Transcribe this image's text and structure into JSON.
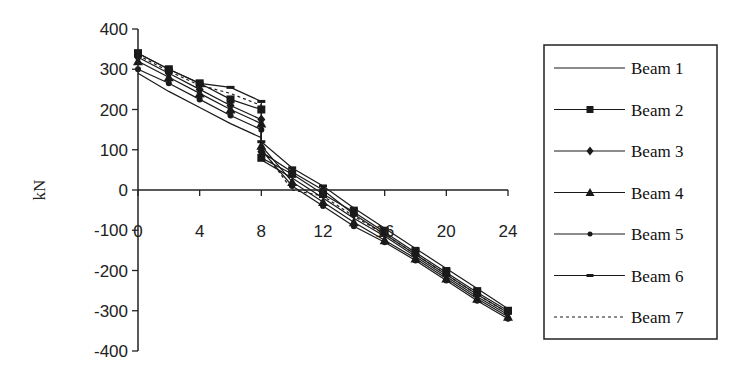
{
  "chart_data": {
    "type": "line",
    "title": "",
    "xlabel": "",
    "ylabel": "kN",
    "xlim": [
      0,
      24
    ],
    "ylim": [
      -400,
      400
    ],
    "x_ticks": [
      0,
      4,
      8,
      12,
      16,
      20,
      24
    ],
    "y_ticks": [
      400,
      300,
      200,
      100,
      0,
      -100,
      -200,
      -300,
      -400
    ],
    "grid": false,
    "legend_position": "right",
    "x": [
      0,
      2,
      4,
      6,
      8,
      8,
      10,
      12,
      14,
      16,
      18,
      20,
      22,
      24
    ],
    "series": [
      {
        "name": "Beam 1",
        "marker": "none",
        "dash": "solid",
        "values": [
          290,
          245,
          205,
          165,
          130,
          75,
          30,
          -20,
          -70,
          -115,
          -165,
          -215,
          -265,
          -310
        ]
      },
      {
        "name": "Beam 2",
        "marker": "square",
        "dash": "solid",
        "values": [
          340,
          300,
          265,
          225,
          200,
          80,
          40,
          -10,
          -55,
          -105,
          -155,
          -205,
          -255,
          -300
        ]
      },
      {
        "name": "Beam 3",
        "marker": "diamond",
        "dash": "solid",
        "values": [
          330,
          290,
          250,
          210,
          175,
          95,
          45,
          0,
          -60,
          -110,
          -160,
          -210,
          -260,
          -305
        ]
      },
      {
        "name": "Beam 4",
        "marker": "triangle",
        "dash": "solid",
        "values": [
          320,
          280,
          240,
          200,
          165,
          110,
          20,
          -30,
          -80,
          -125,
          -170,
          -220,
          -270,
          -315
        ]
      },
      {
        "name": "Beam 5",
        "marker": "circle",
        "dash": "solid",
        "values": [
          300,
          265,
          225,
          185,
          150,
          100,
          10,
          -40,
          -90,
          -130,
          -175,
          -225,
          -275,
          -320
        ]
      },
      {
        "name": "Beam 6",
        "marker": "dash",
        "dash": "solid",
        "values": [
          340,
          300,
          265,
          255,
          220,
          120,
          55,
          10,
          -45,
          -95,
          -145,
          -195,
          -245,
          -295
        ]
      },
      {
        "name": "Beam 7",
        "marker": "none",
        "dash": "dotted",
        "values": [
          335,
          295,
          260,
          240,
          210,
          105,
          0,
          -15,
          -65,
          -110,
          -160,
          -210,
          -260,
          -305
        ]
      }
    ]
  },
  "legend": {
    "items": [
      "Beam 1",
      "Beam 2",
      "Beam 3",
      "Beam 4",
      "Beam 5",
      "Beam 6",
      "Beam 7"
    ]
  },
  "colors": {
    "line": "#1a1a1a",
    "axis": "#222222",
    "background": "#ffffff"
  }
}
